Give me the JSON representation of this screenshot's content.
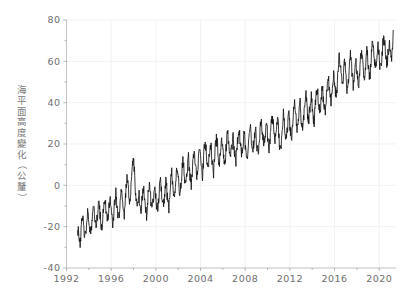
{
  "chart_data": {
    "type": "line",
    "title": "",
    "xlabel": "",
    "ylabel": "海平面高度變化（公釐）",
    "xlim": [
      1992,
      2021.5
    ],
    "ylim": [
      -40,
      80
    ],
    "grid": true,
    "legend": "none",
    "xticks": [
      "1992",
      "1996",
      "2000",
      "2004",
      "2008",
      "2012",
      "2016",
      "2020"
    ],
    "xtick_values": [
      1992,
      1996,
      2000,
      2004,
      2008,
      2012,
      2016,
      2020
    ],
    "yticks": [
      "80",
      "60",
      "40",
      "20",
      "0",
      "-20",
      "-40"
    ],
    "ytick_values": [
      80,
      60,
      40,
      20,
      0,
      -20,
      -40
    ],
    "series": [
      {
        "name": "海平面高度變化",
        "color": "#141414",
        "x": [
          1993.0,
          1993.08,
          1993.17,
          1993.25,
          1993.33,
          1993.42,
          1993.5,
          1993.58,
          1993.67,
          1993.75,
          1993.83,
          1993.92,
          1994.0,
          1994.08,
          1994.17,
          1994.25,
          1994.33,
          1994.42,
          1994.5,
          1994.58,
          1994.67,
          1994.75,
          1994.83,
          1994.92,
          1995.0,
          1995.08,
          1995.17,
          1995.25,
          1995.33,
          1995.42,
          1995.5,
          1995.58,
          1995.67,
          1995.75,
          1995.83,
          1995.92,
          1996.0,
          1996.08,
          1996.17,
          1996.25,
          1996.33,
          1996.42,
          1996.5,
          1996.58,
          1996.67,
          1996.75,
          1996.83,
          1996.92,
          1997.0,
          1997.08,
          1997.17,
          1997.25,
          1997.33,
          1997.42,
          1997.5,
          1997.58,
          1997.67,
          1997.75,
          1997.83,
          1997.92,
          1998.0,
          1998.08,
          1998.17,
          1998.25,
          1998.33,
          1998.42,
          1998.5,
          1998.58,
          1998.67,
          1998.75,
          1998.83,
          1998.92,
          1999.0,
          1999.08,
          1999.17,
          1999.25,
          1999.33,
          1999.42,
          1999.5,
          1999.58,
          1999.67,
          1999.75,
          1999.83,
          1999.92,
          2000.0,
          2000.08,
          2000.17,
          2000.25,
          2000.33,
          2000.42,
          2000.5,
          2000.58,
          2000.67,
          2000.75,
          2000.83,
          2000.92,
          2001.0,
          2001.08,
          2001.17,
          2001.25,
          2001.33,
          2001.42,
          2001.5,
          2001.58,
          2001.67,
          2001.75,
          2001.83,
          2001.92,
          2002.0,
          2002.08,
          2002.17,
          2002.25,
          2002.33,
          2002.42,
          2002.5,
          2002.58,
          2002.67,
          2002.75,
          2002.83,
          2002.92,
          2003.0,
          2003.08,
          2003.17,
          2003.25,
          2003.33,
          2003.42,
          2003.5,
          2003.58,
          2003.67,
          2003.75,
          2003.83,
          2003.92,
          2004.0,
          2004.08,
          2004.17,
          2004.25,
          2004.33,
          2004.42,
          2004.5,
          2004.58,
          2004.67,
          2004.75,
          2004.83,
          2004.92,
          2005.0,
          2005.08,
          2005.17,
          2005.25,
          2005.33,
          2005.42,
          2005.5,
          2005.58,
          2005.67,
          2005.75,
          2005.83,
          2005.92,
          2006.0,
          2006.08,
          2006.17,
          2006.25,
          2006.33,
          2006.42,
          2006.5,
          2006.58,
          2006.67,
          2006.75,
          2006.83,
          2006.92,
          2007.0,
          2007.08,
          2007.17,
          2007.25,
          2007.33,
          2007.42,
          2007.5,
          2007.58,
          2007.67,
          2007.75,
          2007.83,
          2007.92,
          2008.0,
          2008.08,
          2008.17,
          2008.25,
          2008.33,
          2008.42,
          2008.5,
          2008.58,
          2008.67,
          2008.75,
          2008.83,
          2008.92,
          2009.0,
          2009.08,
          2009.17,
          2009.25,
          2009.33,
          2009.42,
          2009.5,
          2009.58,
          2009.67,
          2009.75,
          2009.83,
          2009.92,
          2010.0,
          2010.08,
          2010.17,
          2010.25,
          2010.33,
          2010.42,
          2010.5,
          2010.58,
          2010.67,
          2010.75,
          2010.83,
          2010.92,
          2011.0,
          2011.08,
          2011.17,
          2011.25,
          2011.33,
          2011.42,
          2011.5,
          2011.58,
          2011.67,
          2011.75,
          2011.83,
          2011.92,
          2012.0,
          2012.08,
          2012.17,
          2012.25,
          2012.33,
          2012.42,
          2012.5,
          2012.58,
          2012.67,
          2012.75,
          2012.83,
          2012.92,
          2013.0,
          2013.08,
          2013.17,
          2013.25,
          2013.33,
          2013.42,
          2013.5,
          2013.58,
          2013.67,
          2013.75,
          2013.83,
          2013.92,
          2014.0,
          2014.08,
          2014.17,
          2014.25,
          2014.33,
          2014.42,
          2014.5,
          2014.58,
          2014.67,
          2014.75,
          2014.83,
          2014.92,
          2015.0,
          2015.08,
          2015.17,
          2015.25,
          2015.33,
          2015.42,
          2015.5,
          2015.58,
          2015.67,
          2015.75,
          2015.83,
          2015.92,
          2016.0,
          2016.08,
          2016.17,
          2016.25,
          2016.33,
          2016.42,
          2016.5,
          2016.58,
          2016.67,
          2016.75,
          2016.83,
          2016.92,
          2017.0,
          2017.08,
          2017.17,
          2017.25,
          2017.33,
          2017.42,
          2017.5,
          2017.58,
          2017.67,
          2017.75,
          2017.83,
          2017.92,
          2018.0,
          2018.08,
          2018.17,
          2018.25,
          2018.33,
          2018.42,
          2018.5,
          2018.58,
          2018.67,
          2018.75,
          2018.83,
          2018.92,
          2019.0,
          2019.08,
          2019.17,
          2019.25,
          2019.33,
          2019.42,
          2019.5,
          2019.58,
          2019.67,
          2019.75,
          2019.83,
          2019.92,
          2020.0,
          2020.08,
          2020.17,
          2020.25,
          2020.33,
          2020.42,
          2020.5,
          2020.58,
          2020.67,
          2020.75,
          2020.83,
          2020.92,
          2021.0,
          2021.08,
          2021.17,
          2021.25
        ],
        "y": [
          -21,
          -24,
          -29,
          -27,
          -18,
          -14,
          -17,
          -22,
          -25,
          -22,
          -16,
          -13,
          -16,
          -20,
          -23,
          -19,
          -12,
          -9,
          -13,
          -17,
          -20,
          -16,
          -11,
          -8,
          -14,
          -18,
          -21,
          -16,
          -9,
          -6,
          -10,
          -15,
          -18,
          -14,
          -8,
          -6,
          -12,
          -16,
          -19,
          -13,
          -7,
          -3,
          -8,
          -13,
          -16,
          -12,
          -6,
          -3,
          -9,
          -12,
          -15,
          -8,
          -1,
          4,
          1,
          -4,
          -8,
          -4,
          3,
          9,
          13,
          6,
          -2,
          -7,
          -11,
          -9,
          -5,
          -9,
          -12,
          -8,
          -3,
          -1,
          -7,
          -11,
          -14,
          -9,
          -3,
          0,
          -4,
          -9,
          -12,
          -8,
          -3,
          -1,
          -6,
          -10,
          -13,
          -7,
          -1,
          2,
          -2,
          -7,
          -10,
          -6,
          -1,
          2,
          -4,
          -8,
          -11,
          -5,
          2,
          6,
          2,
          -3,
          -6,
          -2,
          4,
          8,
          3,
          -1,
          -5,
          0,
          7,
          11,
          8,
          3,
          0,
          4,
          9,
          13,
          7,
          3,
          0,
          5,
          12,
          16,
          13,
          8,
          5,
          9,
          14,
          18,
          12,
          8,
          4,
          10,
          17,
          21,
          17,
          12,
          8,
          12,
          17,
          20,
          14,
          10,
          6,
          12,
          19,
          23,
          20,
          14,
          10,
          14,
          19,
          22,
          16,
          12,
          11,
          15,
          21,
          25,
          22,
          17,
          13,
          16,
          20,
          24,
          18,
          14,
          12,
          17,
          23,
          27,
          24,
          19,
          15,
          18,
          22,
          26,
          20,
          16,
          14,
          19,
          25,
          29,
          26,
          21,
          17,
          20,
          24,
          28,
          22,
          18,
          16,
          21,
          27,
          31,
          28,
          23,
          19,
          22,
          26,
          30,
          24,
          20,
          18,
          23,
          29,
          33,
          30,
          25,
          21,
          24,
          28,
          32,
          26,
          19,
          17,
          22,
          29,
          34,
          31,
          26,
          22,
          26,
          31,
          35,
          29,
          25,
          23,
          28,
          35,
          39,
          36,
          31,
          27,
          31,
          36,
          40,
          33,
          29,
          27,
          33,
          40,
          44,
          41,
          35,
          31,
          35,
          40,
          44,
          37,
          33,
          31,
          37,
          44,
          48,
          45,
          39,
          35,
          39,
          44,
          48,
          41,
          37,
          35,
          41,
          48,
          52,
          49,
          44,
          40,
          44,
          49,
          55,
          49,
          45,
          43,
          50,
          58,
          63,
          59,
          53,
          48,
          51,
          56,
          60,
          53,
          48,
          46,
          52,
          59,
          63,
          59,
          53,
          48,
          52,
          57,
          61,
          54,
          50,
          48,
          54,
          61,
          65,
          62,
          56,
          52,
          56,
          61,
          66,
          58,
          54,
          52,
          59,
          66,
          70,
          67,
          61,
          57,
          60,
          64,
          68,
          61,
          57,
          56,
          62,
          69,
          72,
          69,
          63,
          59,
          62,
          66,
          70,
          63,
          60,
          65,
          75
        ]
      }
    ]
  },
  "axes": {
    "y_title": "海平面高度變化（公釐）"
  }
}
